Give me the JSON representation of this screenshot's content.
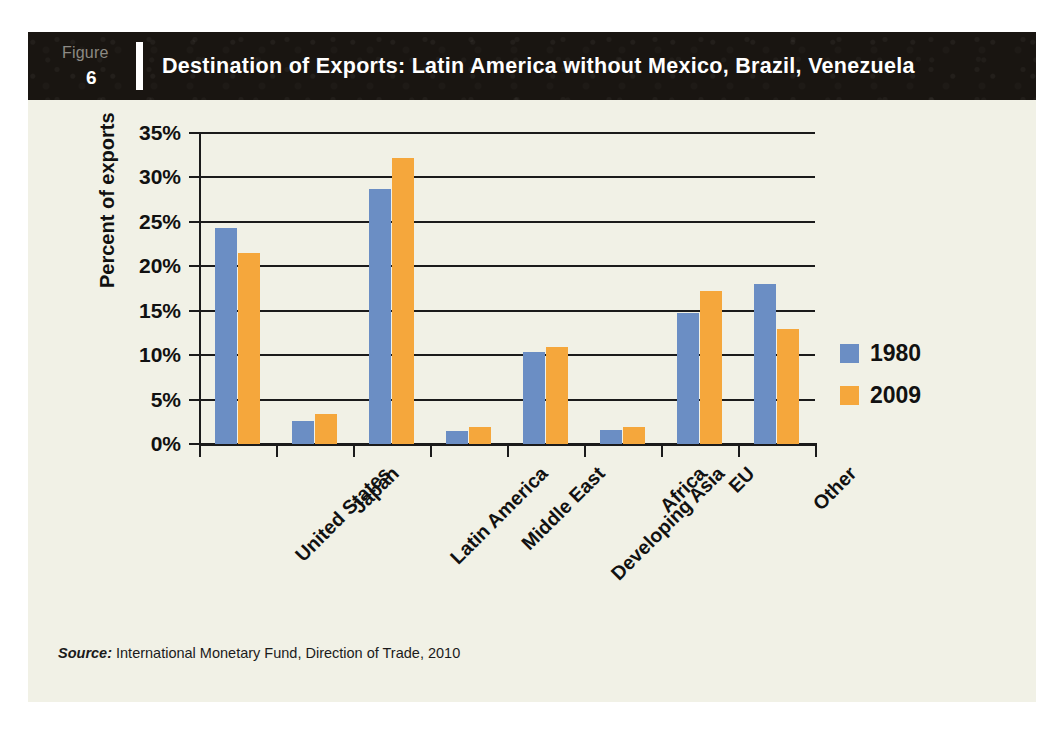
{
  "figure": {
    "label": "Figure",
    "number": "6",
    "title": "Destination of Exports: Latin America without Mexico, Brazil, Venezuela"
  },
  "source": {
    "prefix": "Source:",
    "text": "International Monetary Fund, Direction of Trade, 2010"
  },
  "colors": {
    "series_1980": "#6b8ec4",
    "series_2009": "#f5a73c",
    "header_background": "#191511",
    "panel_background": "#f1f1e6",
    "axis": "#1b1b1b"
  },
  "chart_data": {
    "type": "bar",
    "title": "Destination of Exports: Latin America without Mexico, Brazil, Venezuela",
    "xlabel": "",
    "ylabel": "Percent of exports",
    "ylim": [
      0,
      35
    ],
    "ytick_labels": [
      "35%",
      "30%",
      "25%",
      "20%",
      "15%",
      "10%",
      "5%",
      "0%"
    ],
    "ytick_values": [
      35,
      30,
      25,
      20,
      15,
      10,
      5,
      0
    ],
    "grid": true,
    "legend_position": "right",
    "categories": [
      "United States",
      "Japan",
      "Latin America",
      "Middle East",
      "Developing Asia",
      "Africa",
      "EU",
      "Other"
    ],
    "series": [
      {
        "name": "1980",
        "color": "#6b8ec4",
        "values": [
          24.3,
          2.6,
          28.7,
          1.5,
          10.3,
          1.6,
          14.8,
          18.0
        ]
      },
      {
        "name": "2009",
        "color": "#f5a73c",
        "values": [
          21.5,
          3.4,
          32.2,
          1.9,
          10.9,
          1.9,
          17.2,
          12.9
        ]
      }
    ]
  }
}
